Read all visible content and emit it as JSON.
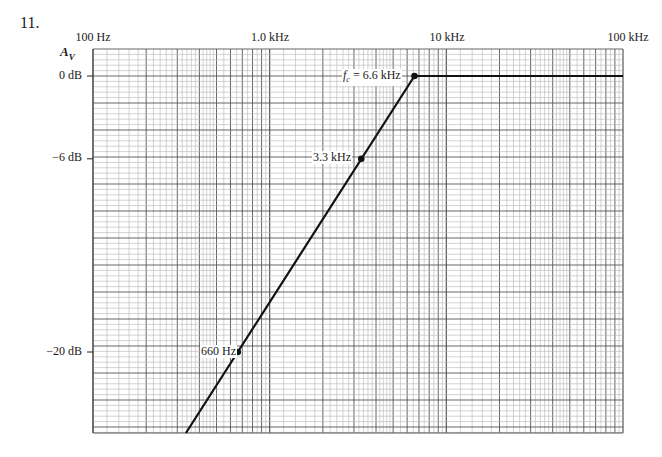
{
  "problem_number": "11.",
  "chart_data": {
    "type": "line",
    "title": "",
    "xlabel": "Frequency (log scale)",
    "ylabel": "A_V",
    "x_scale": "log",
    "x_range_hz": [
      100,
      100000
    ],
    "x_tick_labels": [
      "100 Hz",
      "1.0 kHz",
      "10 kHz",
      "100 kHz"
    ],
    "x_tick_values_hz": [
      100,
      1000,
      10000,
      100000
    ],
    "y_tick_labels": [
      "0 dB",
      "-6 dB",
      "-20 dB"
    ],
    "y_tick_values_db": [
      0,
      -6,
      -20
    ],
    "grid": true,
    "series": [
      {
        "name": "Bode plot (high-pass, +20 dB/decade)",
        "x_hz": [
          450,
          660,
          3300,
          6600,
          100000
        ],
        "y_db": [
          -24,
          -20,
          -6,
          0,
          0
        ]
      }
    ],
    "annotations": [
      {
        "label": "f_c = 6.6 kHz",
        "x_hz": 6600,
        "y_db": 0
      },
      {
        "label": "3.3 kHz",
        "x_hz": 3300,
        "y_db": -6
      },
      {
        "label": "660 Hz",
        "x_hz": 660,
        "y_db": -20
      }
    ]
  },
  "labels": {
    "y_axis_symbol": "A",
    "y_axis_sub": "V",
    "fc_prefix": "f",
    "fc_sub": "c",
    "fc_text": " = 6.6 kHz",
    "pt_3k3": "3.3 kHz",
    "pt_660": "660 Hz",
    "x100": "100 Hz",
    "x1k": "1.0 kHz",
    "x10k": "10 kHz",
    "x100k": "100 kHz",
    "y0": "0 dB",
    "y6": "−6 dB",
    "y20": "−20 dB"
  },
  "colors": {
    "grid_major": "#555555",
    "grid_minor": "#b5b5b5",
    "line": "#111111"
  }
}
